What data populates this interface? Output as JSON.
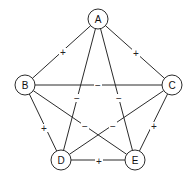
{
  "diagram": {
    "type": "signed-complete-graph",
    "colors": {
      "line": "#2b2b2b",
      "text": "#111111",
      "background": "#ffffff"
    },
    "nodes": [
      {
        "id": "A",
        "label": "A",
        "x": 98,
        "y": 19
      },
      {
        "id": "B",
        "label": "B",
        "x": 25,
        "y": 85
      },
      {
        "id": "C",
        "label": "C",
        "x": 172,
        "y": 85
      },
      {
        "id": "D",
        "label": "D",
        "x": 61,
        "y": 160
      },
      {
        "id": "E",
        "label": "E",
        "x": 135,
        "y": 160
      }
    ],
    "node_radius": 10,
    "edges": [
      {
        "from": "A",
        "to": "B",
        "sign": "+",
        "lx": 63,
        "ly": 52
      },
      {
        "from": "A",
        "to": "C",
        "sign": "+",
        "lx": 136,
        "ly": 53
      },
      {
        "from": "A",
        "to": "D",
        "sign": "−",
        "lx": 77,
        "ly": 98
      },
      {
        "from": "A",
        "to": "E",
        "sign": "−",
        "lx": 119,
        "ly": 98
      },
      {
        "from": "B",
        "to": "C",
        "sign": "−",
        "lx": 98,
        "ly": 85
      },
      {
        "from": "B",
        "to": "D",
        "sign": "+",
        "lx": 44,
        "ly": 128
      },
      {
        "from": "B",
        "to": "E",
        "sign": "−",
        "lx": 85,
        "ly": 126
      },
      {
        "from": "C",
        "to": "D",
        "sign": "−",
        "lx": 113,
        "ly": 126
      },
      {
        "from": "C",
        "to": "E",
        "sign": "+",
        "lx": 154,
        "ly": 126
      },
      {
        "from": "D",
        "to": "E",
        "sign": "+",
        "lx": 99,
        "ly": 161
      }
    ]
  }
}
